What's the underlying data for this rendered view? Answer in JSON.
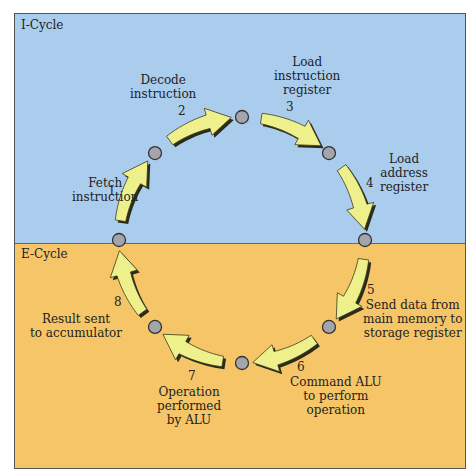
{
  "cycles": {
    "top": {
      "label": "I-Cycle",
      "color": "#aacdee"
    },
    "bottom": {
      "label": "E-Cycle",
      "color": "#f5c567"
    }
  },
  "colors": {
    "arrow_fill": "#eef08c",
    "arrow_shadow": "#2b2b1a",
    "node_fill": "#a4a4ac"
  },
  "steps": [
    {
      "num": "1",
      "lines": [
        "Fetch",
        "instruction"
      ]
    },
    {
      "num": "2",
      "lines": [
        "Decode",
        "instruction"
      ]
    },
    {
      "num": "3",
      "lines": [
        "Load",
        "instruction",
        "register"
      ]
    },
    {
      "num": "4",
      "lines": [
        "Load",
        "address",
        "register"
      ]
    },
    {
      "num": "5",
      "lines": [
        "Send data from",
        "main memory to",
        "storage register"
      ]
    },
    {
      "num": "6",
      "lines": [
        "Command ALU",
        "to perform",
        "operation"
      ]
    },
    {
      "num": "7",
      "lines": [
        "Operation",
        "performed",
        "by ALU"
      ]
    },
    {
      "num": "8",
      "lines": [
        "Result sent",
        "to accumulator"
      ]
    }
  ]
}
